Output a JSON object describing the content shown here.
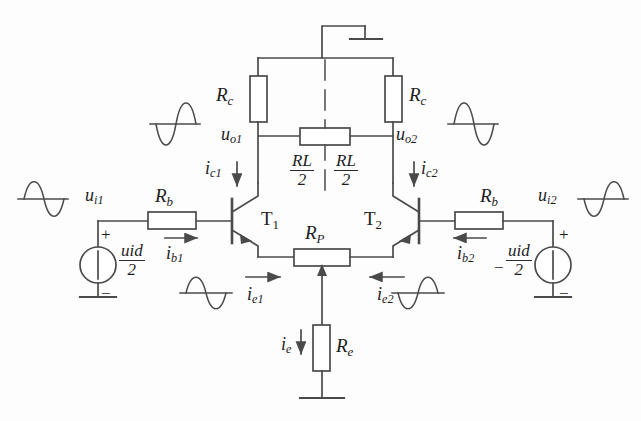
{
  "diagram": {
    "stroke": "#4a4a4a",
    "text_color": "#1c1c1c"
  },
  "components": {
    "rc_left": "R",
    "rc_left_sub": "c",
    "rc_right": "R",
    "rc_right_sub": "c",
    "rb_left": "R",
    "rb_left_sub": "b",
    "rb_right": "R",
    "rb_right_sub": "b",
    "rp": "R",
    "rp_sub": "P",
    "re": "R",
    "re_sub": "e",
    "rl_left_num": "R",
    "rl_left_num_sub": "L",
    "rl_left_den": "2",
    "rl_right_num": "R",
    "rl_right_num_sub": "L",
    "rl_right_den": "2",
    "transistor_left": "T",
    "transistor_left_sub": "1",
    "transistor_right": "T",
    "transistor_right_sub": "2"
  },
  "nodes": {
    "ui1": "u",
    "ui1_sub": "i1",
    "ui2": "u",
    "ui2_sub": "i2",
    "uo1": "u",
    "uo1_sub": "o1",
    "uo2": "u",
    "uo2_sub": "o2"
  },
  "currents": {
    "ic1": "i",
    "ic1_sub": "c1",
    "ic2": "i",
    "ic2_sub": "c2",
    "ib1": "i",
    "ib1_sub": "b1",
    "ib2": "i",
    "ib2_sub": "b2",
    "ie1": "i",
    "ie1_sub": "e1",
    "ie2": "i",
    "ie2_sub": "e2",
    "ie": "i",
    "ie_sub": "e"
  },
  "sources": {
    "left_num": "u",
    "left_num_sub": "id",
    "left_den": "2",
    "left_plus": "+",
    "left_minus": "−",
    "right_neg_prefix": "−",
    "right_num": "u",
    "right_num_sub": "id",
    "right_den": "2",
    "right_plus": "+",
    "right_minus": "−"
  }
}
